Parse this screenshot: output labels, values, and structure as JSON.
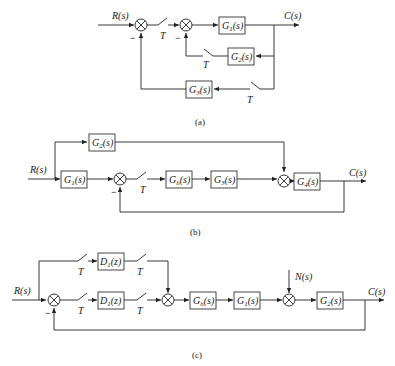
{
  "figure": "Three sampled-data control system block diagrams",
  "diagrams": [
    {
      "caption": "(a)",
      "input": "R(s)",
      "output": "C(s)",
      "blocks": [
        "G1(s)",
        "G2(s)",
        "G3(s)"
      ],
      "samplers": [
        "T",
        "T",
        "T"
      ],
      "summing_signs": [
        "−",
        "−"
      ]
    },
    {
      "caption": "(b)",
      "input": "R(s)",
      "output": "C(s)",
      "blocks": [
        "G2(s)",
        "G1(s)",
        "Gh(s)",
        "G3(s)",
        "G4(s)"
      ],
      "samplers": [
        "T"
      ],
      "summing_signs": [
        "−"
      ]
    },
    {
      "caption": "(c)",
      "input": "R(s)",
      "output": "C(s)",
      "disturbance": "N(s)",
      "blocks": [
        "D1(z)",
        "D1(z)",
        "Gh(s)",
        "G1(s)",
        "G2(s)"
      ],
      "samplers": [
        "T",
        "T",
        "T",
        "T"
      ],
      "summing_signs": [
        "−"
      ]
    }
  ],
  "labels": {
    "R": "R(s)",
    "C": "C(s)",
    "N": "N(s)",
    "T": "T",
    "minus": "−",
    "a": "(a)",
    "b": "(b)",
    "c": "(c)",
    "G1": "G",
    "G1sub": "1",
    "G2sub": "2",
    "G3sub": "3",
    "G4sub": "4",
    "Ghsub": "h",
    "D": "D",
    "D1sub": "1",
    "s": "(s)",
    "z": "(z)"
  }
}
